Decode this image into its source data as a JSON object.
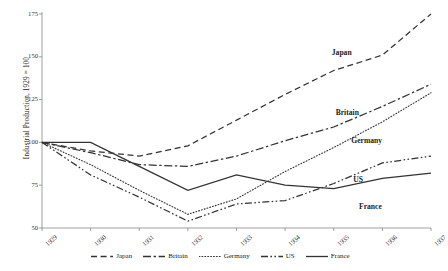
{
  "chart_data": {
    "type": "line",
    "title": "",
    "xlabel": "",
    "ylabel": "Industrial Production, 1929 = 100",
    "x": [
      "1929",
      "1930",
      "1931",
      "1932",
      "1933",
      "1934",
      "1935",
      "1936",
      "1937"
    ],
    "xlim": [
      1929,
      1937
    ],
    "ylim": [
      50,
      175
    ],
    "yticks": [
      175,
      150,
      125,
      100,
      75,
      50
    ],
    "grid": false,
    "legend_position": "bottom",
    "series": [
      {
        "name": "Japan",
        "style": "dashed",
        "color": "#333333",
        "values": [
          100,
          95,
          92,
          98,
          113,
          128,
          142,
          151,
          175
        ]
      },
      {
        "name": "Britain",
        "style": "dash-dot",
        "color": "#333333",
        "values": [
          100,
          94,
          87,
          86,
          92,
          101,
          109,
          121,
          134
        ]
      },
      {
        "name": "Germany",
        "style": "dotted",
        "color": "#333333",
        "values": [
          100,
          87,
          72,
          58,
          67,
          83,
          97,
          112,
          129
        ]
      },
      {
        "name": "US",
        "style": "dash-dot-dot",
        "color": "#333333",
        "values": [
          100,
          81,
          68,
          54,
          64,
          66,
          76,
          88,
          92
        ]
      },
      {
        "name": "France",
        "style": "solid",
        "color": "#333333",
        "values": [
          100,
          100,
          86,
          72,
          81,
          75,
          73,
          79,
          82
        ]
      }
    ],
    "inline_labels": [
      {
        "text": "Japan",
        "x": 0.745,
        "value": 152
      },
      {
        "text": "Britain",
        "x": 0.755,
        "value": 117
      },
      {
        "text": "Germany",
        "x": 0.795,
        "value": 101
      },
      {
        "text": "US",
        "x": 0.8,
        "value": 78
      },
      {
        "text": "France",
        "x": 0.815,
        "value": 62
      }
    ]
  },
  "legend": {
    "items": [
      {
        "label": "Japan",
        "style": "dashed"
      },
      {
        "label": "Britain",
        "style": "dash-dot"
      },
      {
        "label": "Germany",
        "style": "dotted"
      },
      {
        "label": "US",
        "style": "dash-dot-dot"
      },
      {
        "label": "France",
        "style": "solid"
      }
    ]
  }
}
